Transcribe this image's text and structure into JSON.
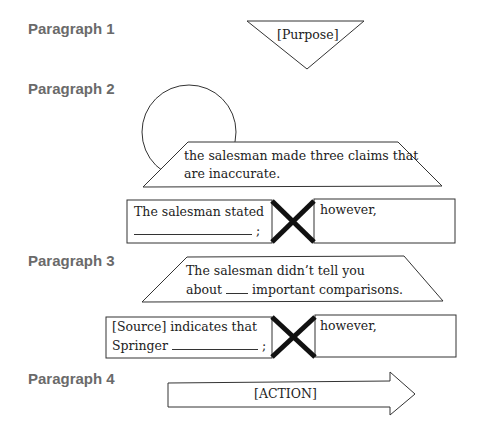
{
  "paragraphs": [
    {
      "label": "Paragraph 1",
      "shape": "inverted-triangle",
      "text": "[Purpose]"
    },
    {
      "label": "Paragraph 2",
      "shape": "circle-with-trapezoid",
      "trapezoid_lines": [
        "the salesman made three claims that",
        "are inaccurate."
      ],
      "left_box": {
        "line1": "The salesman stated",
        "line2_suffix": ";"
      },
      "right_box": {
        "line1": "however,"
      }
    },
    {
      "label": "Paragraph 3",
      "shape": "trapezoid",
      "trapezoid_lines": [
        "The salesman didn’t tell you",
        "about",
        "important comparisons."
      ],
      "left_box": {
        "line1": "[Source] indicates that",
        "line2_prefix": "Springer",
        "line2_suffix": ";"
      },
      "right_box": {
        "line1": "however,"
      }
    },
    {
      "label": "Paragraph 4",
      "shape": "right-arrow",
      "text": "[ACTION]"
    }
  ],
  "colors": {
    "label": "#6a6a6a",
    "stroke": "#333333",
    "cross": "#111111",
    "background": "#ffffff"
  }
}
